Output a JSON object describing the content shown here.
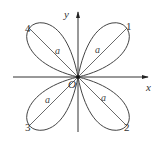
{
  "diagram": {
    "type": "polar-curve",
    "colors": {
      "stroke": "#333333",
      "background": "#ffffff"
    },
    "axes": {
      "x_label": "x",
      "y_label": "y",
      "origin_label": "O"
    },
    "petals": [
      {
        "number_label": "1",
        "length_label": "a",
        "direction": "upper-right"
      },
      {
        "number_label": "2",
        "length_label": "a",
        "direction": "lower-right"
      },
      {
        "number_label": "3",
        "length_label": "a",
        "direction": "lower-left"
      },
      {
        "number_label": "4",
        "length_label": "a",
        "direction": "upper-left"
      }
    ]
  }
}
